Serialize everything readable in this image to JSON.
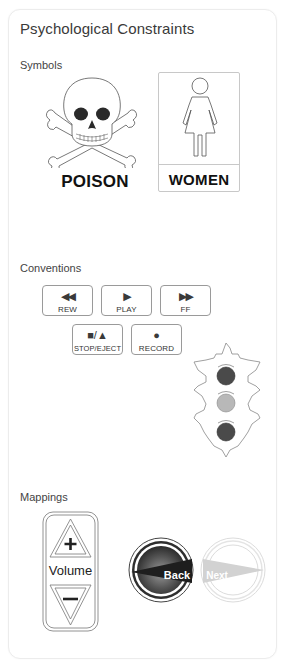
{
  "card": {
    "title": "Psychological Constraints"
  },
  "sections": {
    "symbols": {
      "label": "Symbols",
      "items": [
        {
          "icon": "skull-crossbones-icon",
          "caption": "POISON"
        },
        {
          "icon": "women-restroom-icon",
          "caption": "WOMEN"
        }
      ]
    },
    "conventions": {
      "label": "Conventions",
      "media_buttons": [
        {
          "id": "rew",
          "glyph": "◀◀",
          "label": "REW"
        },
        {
          "id": "play",
          "glyph": "▶",
          "label": "PLAY"
        },
        {
          "id": "ff",
          "glyph": "▶▶",
          "label": "FF"
        },
        {
          "id": "stop-eject",
          "glyph": "■/▲",
          "label": "STOP/EJECT"
        },
        {
          "id": "record",
          "glyph": "●",
          "label": "RECORD"
        }
      ],
      "traffic_light": {
        "icon": "traffic-light-icon",
        "lights": [
          {
            "position": "top",
            "color": "#4a4a4a"
          },
          {
            "position": "middle",
            "color": "#b5b5b5"
          },
          {
            "position": "bottom",
            "color": "#4a4a4a"
          }
        ]
      }
    },
    "mappings": {
      "label": "Mappings",
      "volume": {
        "label": "Volume",
        "up_symbol": "+",
        "down_symbol": "−"
      },
      "back_button": {
        "label": "Back"
      },
      "next_button": {
        "label": "Next"
      }
    }
  },
  "colors": {
    "border": "#ececec",
    "outline": "#9a9a9a",
    "dark_fill": "#4a4a4a",
    "faded": "#d0d0d0"
  }
}
